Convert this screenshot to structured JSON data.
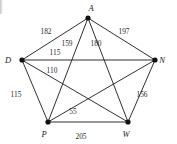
{
  "figure": {
    "kind": "weighted-complete-graph",
    "background_color": "#ffffff",
    "line_color": "#1a1a1a",
    "vertex_color": "#111111"
  },
  "chart_data": {
    "type": "diagram",
    "title": "",
    "xlabel": "",
    "ylabel": "",
    "graph_type": "complete-graph-K5",
    "nodes": [
      {
        "id": "A",
        "label": "A",
        "x": 88,
        "y": 18,
        "label_x": 91,
        "label_y": 11
      },
      {
        "id": "D",
        "label": "D",
        "x": 22,
        "y": 60,
        "label_x": 8,
        "label_y": 63
      },
      {
        "id": "N",
        "label": "N",
        "x": 155,
        "y": 60,
        "label_x": 162,
        "label_y": 63
      },
      {
        "id": "P",
        "label": "P",
        "x": 48,
        "y": 122,
        "label_x": 44,
        "label_y": 137
      },
      {
        "id": "W",
        "label": "W",
        "x": 128,
        "y": 122,
        "label_x": 126,
        "label_y": 137
      }
    ],
    "edges": [
      {
        "from": "A",
        "to": "D",
        "weight": 182,
        "label_x": 46,
        "label_y": 34
      },
      {
        "from": "A",
        "to": "N",
        "weight": 197,
        "label_x": 124,
        "label_y": 34
      },
      {
        "from": "A",
        "to": "P",
        "weight": 159,
        "label_x": 67,
        "label_y": 46
      },
      {
        "from": "A",
        "to": "W",
        "weight": 180,
        "label_x": 96,
        "label_y": 46
      },
      {
        "from": "D",
        "to": "N",
        "weight": 115,
        "label_x": 55,
        "label_y": 55
      },
      {
        "from": "D",
        "to": "W",
        "weight": 110,
        "label_x": 52,
        "label_y": 73
      },
      {
        "from": "D",
        "to": "P",
        "weight": 115,
        "label_x": 16,
        "label_y": 97
      },
      {
        "from": "N",
        "to": "W",
        "weight": 156,
        "label_x": 142,
        "label_y": 97
      },
      {
        "from": "N",
        "to": "P",
        "weight": 55,
        "label_x": 73,
        "label_y": 114
      },
      {
        "from": "P",
        "to": "W",
        "weight": 205,
        "label_x": 81,
        "label_y": 139
      }
    ],
    "node_count": 5,
    "edge_count": 10
  }
}
